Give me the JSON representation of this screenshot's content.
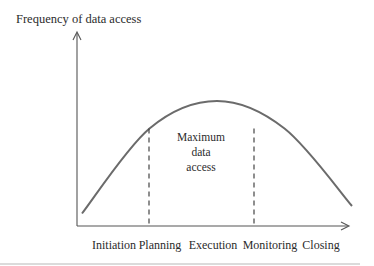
{
  "chart_data": {
    "type": "line",
    "title": "",
    "ylabel": "Frequency of data access",
    "xlabel": "",
    "categories": [
      "Initiation",
      "Planning",
      "Execution",
      "Monitoring",
      "Closing"
    ],
    "series": [
      {
        "name": "Frequency of data access",
        "x": [
          0,
          0.25,
          0.5,
          0.75,
          1.0
        ],
        "values": [
          0.1,
          0.78,
          1.0,
          0.78,
          0.16
        ]
      }
    ],
    "markers": [
      {
        "type": "dashed-vertical",
        "at_category": "Planning"
      },
      {
        "type": "dashed-vertical",
        "at_category": "Monitoring"
      }
    ],
    "annotation": {
      "lines": [
        "Maximum",
        "data",
        "access"
      ],
      "region": "between Planning and Monitoring"
    },
    "grid": false,
    "axis_ticks": false
  }
}
